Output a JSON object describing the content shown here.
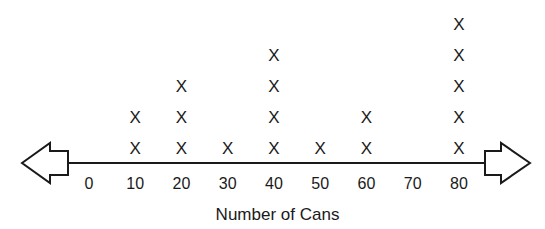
{
  "chart_data": {
    "type": "line-plot (dot plot with X marks)",
    "title": "",
    "xlabel": "Number of Cans",
    "ylabel": "",
    "categories": [
      "0",
      "10",
      "20",
      "30",
      "40",
      "50",
      "60",
      "70",
      "80"
    ],
    "x": [
      0,
      10,
      20,
      30,
      40,
      50,
      60,
      70,
      80
    ],
    "values": [
      0,
      2,
      3,
      1,
      4,
      1,
      2,
      0,
      5
    ],
    "marker": "X",
    "axis": {
      "arrows": "both ends (hollow block arrows)",
      "grid": false
    },
    "legend": null
  },
  "axis_label": "Number of Cans",
  "marker_glyph": "X",
  "colors": {
    "ink": "#1a1a1a",
    "background": "#ffffff"
  }
}
